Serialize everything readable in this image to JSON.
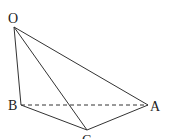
{
  "diagram": {
    "type": "tetrahedron",
    "points": {
      "O": {
        "label": "O",
        "x": 14,
        "y": 27
      },
      "A": {
        "label": "A",
        "x": 148,
        "y": 105
      },
      "B": {
        "label": "B",
        "x": 21,
        "y": 105
      },
      "C": {
        "label": "C",
        "x": 87,
        "y": 130
      }
    },
    "edges": [
      {
        "from": "O",
        "to": "A",
        "style": "solid"
      },
      {
        "from": "O",
        "to": "B",
        "style": "solid"
      },
      {
        "from": "O",
        "to": "C",
        "style": "solid"
      },
      {
        "from": "B",
        "to": "C",
        "style": "solid"
      },
      {
        "from": "C",
        "to": "A",
        "style": "solid"
      },
      {
        "from": "B",
        "to": "A",
        "style": "dashed"
      }
    ],
    "line_color": "#333333"
  }
}
